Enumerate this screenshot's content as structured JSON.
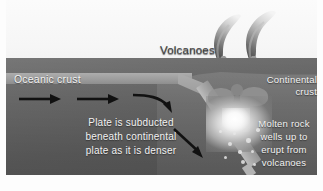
{
  "figure": {
    "labels": {
      "volcanoes": "Volcanoes",
      "oceanic_crust": "Oceanic crust",
      "continental_crust": "Continental\ncrust",
      "subduction": "Plate is subducted\nbeneath continental\nplate as it is denser",
      "molten_rock": "Molten rock\nwells up to\nerupt from\nvolcanoes"
    },
    "colors": {
      "background": "#fdfdfd",
      "mantle": "#666666",
      "continental_block": "#7b7b7b",
      "oceanic_slab": "#a9a9a9",
      "magma": "#ffffff",
      "label_light": "#f2f2f2",
      "label_dark": "#3f3f3f",
      "arrow": "#111111",
      "plume": "#8a8a8a"
    },
    "arrows": [
      {
        "name": "plate-motion-arrow-1",
        "direction": "right"
      },
      {
        "name": "plate-motion-arrow-2",
        "direction": "right"
      },
      {
        "name": "plate-motion-arrow-3",
        "direction": "curving-down-right"
      },
      {
        "name": "subduction-descent-arrow",
        "direction": "down-right-diagonal"
      }
    ],
    "volcano_count": 2,
    "plume_count": 2
  }
}
